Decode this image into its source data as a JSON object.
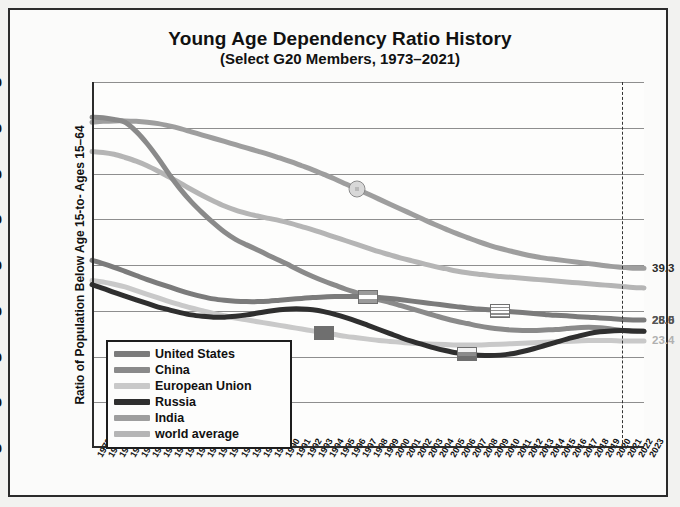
{
  "chart_data": {
    "type": "line",
    "title": "Young Age Dependency Ratio History",
    "subtitle": "(Select G20 Members, 1973–2021)",
    "xlabel": "",
    "ylabel": "Ratio of Population Below Age 15-to- Ages 15–64",
    "ylim": [
      0,
      80
    ],
    "yticks": [
      0,
      10,
      20,
      30,
      40,
      50,
      60,
      70,
      80
    ],
    "grid": true,
    "legend_position": "inside-lower-left",
    "x": [
      1973,
      1974,
      1975,
      1976,
      1977,
      1978,
      1979,
      1980,
      1981,
      1982,
      1983,
      1984,
      1985,
      1986,
      1987,
      1988,
      1989,
      1990,
      1991,
      1992,
      1993,
      1994,
      1995,
      1996,
      1997,
      1998,
      1999,
      2000,
      2001,
      2002,
      2003,
      2004,
      2005,
      2006,
      2007,
      2008,
      2009,
      2010,
      2011,
      2012,
      2013,
      2014,
      2015,
      2016,
      2017,
      2018,
      2019,
      2020,
      2021,
      2022,
      2023
    ],
    "xticks": [
      "1973",
      "1974",
      "1975",
      "1976",
      "1977",
      "1978",
      "1979",
      "1980",
      "1981",
      "1982",
      "1983",
      "1984",
      "1985",
      "1986",
      "1987",
      "1988",
      "1989",
      "1990",
      "1991",
      "1992",
      "1993",
      "1994",
      "1995",
      "1996",
      "1997",
      "1998",
      "1999",
      "2000",
      "2001",
      "2002",
      "2003",
      "2004",
      "2005",
      "2006",
      "2007",
      "2008",
      "2009",
      "2010",
      "2011",
      "2012",
      "2013",
      "2014",
      "2015",
      "2016",
      "2017",
      "2018",
      "2019",
      "2020",
      "2021",
      "2022",
      "2023"
    ],
    "xlim": [
      1973,
      2023
    ],
    "marker_year": 2021,
    "series": [
      {
        "name": "United States",
        "color": "#7b7b7b",
        "end_value": 28.0,
        "end_label": "28.0",
        "end_label_color": "#4a4a4a",
        "values": [
          41.0,
          40.3,
          39.5,
          38.6,
          37.7,
          36.8,
          36.0,
          35.2,
          34.4,
          33.7,
          33.1,
          32.6,
          32.3,
          32.1,
          32.0,
          32.0,
          32.1,
          32.3,
          32.5,
          32.7,
          32.9,
          33.0,
          33.1,
          33.1,
          33.1,
          33.0,
          32.9,
          32.7,
          32.4,
          32.1,
          31.8,
          31.5,
          31.2,
          30.9,
          30.6,
          30.4,
          30.2,
          30.0,
          29.8,
          29.6,
          29.4,
          29.2,
          29.0,
          28.9,
          28.7,
          28.6,
          28.4,
          28.3,
          28.1,
          28.0,
          28.0
        ],
        "marker": {
          "year": 2010,
          "value": 30.0,
          "shape": "rect",
          "flag": "us-flag-marker"
        }
      },
      {
        "name": "China",
        "color": "#8a8a8a",
        "end_value": 25.5,
        "end_label": "25.5",
        "end_label_color": "#555555",
        "values": [
          72.3,
          72.2,
          71.8,
          71.2,
          69.2,
          66.5,
          63.3,
          59.8,
          56.6,
          53.8,
          51.4,
          49.2,
          47.2,
          45.6,
          44.4,
          43.3,
          42.1,
          41.0,
          39.8,
          38.6,
          37.5,
          36.5,
          35.6,
          34.7,
          33.9,
          33.1,
          32.4,
          31.8,
          31.1,
          30.4,
          29.7,
          29.0,
          28.3,
          27.7,
          27.2,
          26.7,
          26.3,
          26.0,
          25.8,
          25.7,
          25.7,
          25.8,
          25.9,
          26.1,
          26.3,
          26.4,
          26.3,
          26.0,
          25.7,
          25.5,
          25.5
        ],
        "marker": {
          "year": 1998,
          "value": 33.1,
          "shape": "rect",
          "flag": "china-flag-marker"
        }
      },
      {
        "name": "European Union",
        "color": "#c9c9c9",
        "end_value": 23.4,
        "end_label": "23.4",
        "end_label_color": "#b0b0b0",
        "values": [
          36.6,
          36.3,
          35.8,
          35.2,
          34.4,
          33.6,
          32.8,
          32.0,
          31.3,
          30.6,
          30.0,
          29.4,
          28.9,
          28.4,
          28.0,
          27.6,
          27.2,
          26.8,
          26.4,
          26.0,
          25.6,
          25.2,
          24.8,
          24.4,
          24.1,
          23.8,
          23.5,
          23.3,
          23.1,
          22.9,
          22.8,
          22.7,
          22.6,
          22.5,
          22.5,
          22.5,
          22.6,
          22.7,
          22.8,
          22.9,
          23.0,
          23.1,
          23.2,
          23.3,
          23.4,
          23.5,
          23.5,
          23.5,
          23.4,
          23.4,
          23.4
        ],
        "marker": {
          "year": 1994,
          "value": 25.2,
          "shape": "rect",
          "flag": "eu-flag-marker"
        }
      },
      {
        "name": "Russia",
        "color": "#2f2f2f",
        "end_value": 25.5,
        "end_label": "",
        "end_label_color": "#2f2f2f",
        "values": [
          35.7,
          34.9,
          34.0,
          33.2,
          32.4,
          31.6,
          30.8,
          30.2,
          29.6,
          29.1,
          28.8,
          28.6,
          28.6,
          28.8,
          29.1,
          29.5,
          29.9,
          30.2,
          30.4,
          30.4,
          30.2,
          29.8,
          29.2,
          28.5,
          27.7,
          26.8,
          25.9,
          25.0,
          24.1,
          23.3,
          22.6,
          21.9,
          21.3,
          20.8,
          20.5,
          20.3,
          20.2,
          20.3,
          20.6,
          21.1,
          21.7,
          22.4,
          23.1,
          23.8,
          24.4,
          25.0,
          25.4,
          25.6,
          25.7,
          25.6,
          25.5
        ],
        "marker": {
          "year": 2007,
          "value": 20.5,
          "shape": "rect",
          "flag": "russia-flag-marker"
        }
      },
      {
        "name": "India",
        "color": "#9e9e9e",
        "end_value": 39.3,
        "end_label": "39.3",
        "end_label_color": "#2b2b2b",
        "values": [
          71.2,
          71.4,
          71.5,
          71.5,
          71.4,
          71.2,
          70.9,
          70.4,
          69.8,
          69.1,
          68.4,
          67.7,
          67.0,
          66.3,
          65.6,
          64.9,
          64.2,
          63.4,
          62.6,
          61.7,
          60.8,
          59.8,
          58.8,
          57.7,
          56.6,
          55.5,
          54.4,
          53.3,
          52.2,
          51.1,
          50.0,
          48.9,
          47.9,
          46.9,
          46.0,
          45.1,
          44.3,
          43.6,
          43.0,
          42.4,
          41.9,
          41.5,
          41.2,
          40.9,
          40.6,
          40.3,
          40.0,
          39.7,
          39.5,
          39.3,
          39.3
        ],
        "marker": {
          "year": 1997,
          "value": 56.6,
          "shape": "circ",
          "flag": "india-flag-marker"
        }
      },
      {
        "name": "world average",
        "color": "#b5b5b5",
        "end_value": 39.3,
        "end_label": "",
        "end_label_color": "#b5b5b5",
        "values": [
          64.8,
          64.6,
          64.2,
          63.5,
          62.7,
          61.7,
          60.5,
          59.2,
          57.9,
          56.5,
          55.2,
          54.0,
          52.9,
          52.0,
          51.3,
          50.7,
          50.2,
          49.7,
          49.1,
          48.4,
          47.7,
          46.9,
          46.1,
          45.3,
          44.5,
          43.7,
          42.9,
          42.2,
          41.5,
          40.9,
          40.3,
          39.7,
          39.2,
          38.7,
          38.3,
          38.0,
          37.7,
          37.5,
          37.3,
          37.1,
          36.9,
          36.7,
          36.5,
          36.3,
          36.1,
          35.9,
          35.7,
          35.5,
          35.3,
          35.1,
          35.0
        ],
        "marker": null
      }
    ]
  },
  "legend": {
    "items": [
      {
        "label": "United States"
      },
      {
        "label": "China"
      },
      {
        "label": "European Union"
      },
      {
        "label": "Russia"
      },
      {
        "label": "India"
      },
      {
        "label": "world average"
      }
    ]
  }
}
